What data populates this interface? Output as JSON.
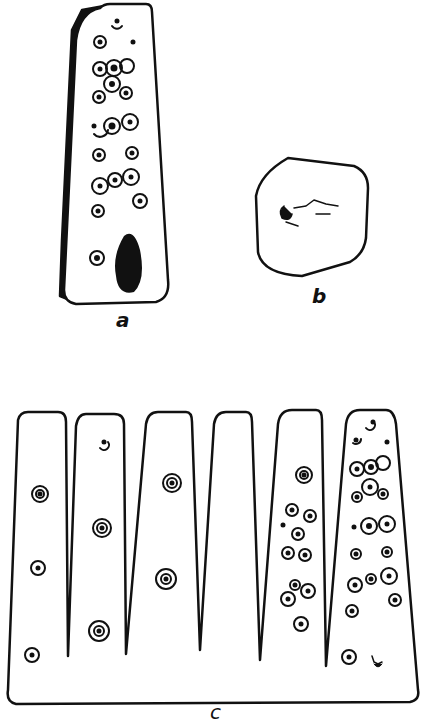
{
  "figure": {
    "parts": [
      {
        "id": "a",
        "label": "a",
        "description": "tapered object with incised dot-and-circle designs, shaded left side"
      },
      {
        "id": "b",
        "label": "b",
        "description": "hexagonal end view with marking"
      },
      {
        "id": "c",
        "label": "c",
        "description": "unrolled pattern of six tapering panels with dot-and-circle designs"
      }
    ],
    "colors": {
      "ink": "#111111",
      "paper": "#ffffff"
    }
  }
}
